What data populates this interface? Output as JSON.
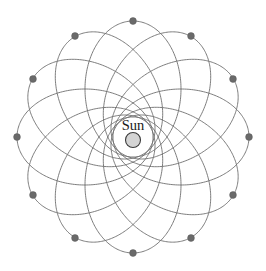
{
  "figure": {
    "background_color": "#ffffff",
    "width": 266,
    "height": 271,
    "center": {
      "x": 133,
      "y": 137
    }
  },
  "sun": {
    "label": "Sun",
    "label_position": {
      "x": 133,
      "y": 130
    },
    "label_font_size": 14.5,
    "body_center": {
      "x": 133,
      "y": 140
    },
    "body_radius": 7.5,
    "body_fill": "#d4d4d4",
    "body_stroke": "#3a3a3a"
  },
  "orbits": {
    "count": 12,
    "precession_step_degrees": 30,
    "stroke_color": "#6e6e6e",
    "stroke_width": 0.9,
    "semi_major_axis": 68,
    "semi_minor_axis": 48,
    "focus_offset": 48,
    "perihelion_radius": 20,
    "aphelion_radius": 116,
    "rotation_angles_degrees": [
      0,
      30,
      60,
      90,
      120,
      150,
      180,
      210,
      240,
      270,
      300,
      330
    ]
  },
  "markers": {
    "name": "aphelion-marker",
    "count": 12,
    "radius": 3.4,
    "fill": "#6a6a6a",
    "stroke": "#5a5a5a",
    "positions": [
      {
        "angle_degrees": 270,
        "x": 133,
        "y": 21
      },
      {
        "angle_degrees": 300,
        "x": 191,
        "y": 36
      },
      {
        "angle_degrees": 330,
        "x": 233,
        "y": 79
      },
      {
        "angle_degrees": 0,
        "x": 249,
        "y": 137
      },
      {
        "angle_degrees": 30,
        "x": 233,
        "y": 195
      },
      {
        "angle_degrees": 60,
        "x": 191,
        "y": 238
      },
      {
        "angle_degrees": 90,
        "x": 133,
        "y": 253
      },
      {
        "angle_degrees": 120,
        "x": 75,
        "y": 238
      },
      {
        "angle_degrees": 150,
        "x": 33,
        "y": 195
      },
      {
        "angle_degrees": 180,
        "x": 17,
        "y": 137
      },
      {
        "angle_degrees": 210,
        "x": 33,
        "y": 79
      },
      {
        "angle_degrees": 240,
        "x": 75,
        "y": 36
      }
    ]
  },
  "chart_data": {
    "type": "scatter",
    "xlabel": "",
    "ylabel": "",
    "annotations": [
      "Sun"
    ],
    "series": [
      {
        "name": "orbit-ellipses",
        "description": "12 congruent ellipses sharing a focus at the Sun, each rotated 30 degrees from the previous",
        "values": [
          0,
          30,
          60,
          90,
          120,
          150,
          180,
          210,
          240,
          270,
          300,
          330
        ]
      },
      {
        "name": "aphelion-points",
        "description": "Marker dot at the far apse of each ellipse",
        "values": [
          116,
          116,
          116,
          116,
          116,
          116,
          116,
          116,
          116,
          116,
          116,
          116
        ]
      }
    ]
  }
}
